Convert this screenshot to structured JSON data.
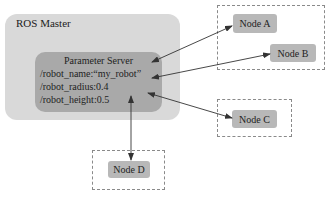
{
  "master": {
    "title": "ROS Master",
    "parameter_server": {
      "title": "Parameter Server",
      "params": [
        "/robot_name:“my_robot”",
        "/robot_radius:0.4",
        "/robot_height:0.5"
      ]
    }
  },
  "nodes": {
    "a": "Node A",
    "b": "Node B",
    "c": "Node C",
    "d": "Node D"
  },
  "colors": {
    "master_fill": "#d9d9d9",
    "param_fill": "#a9a9a9",
    "node_fill": "#b8b8b8",
    "dash_border": "#8a8a8a",
    "arrow": "#333333"
  }
}
